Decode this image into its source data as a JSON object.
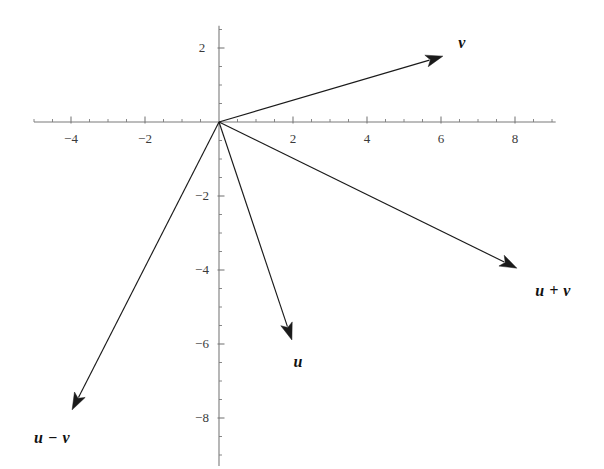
{
  "chart_data": {
    "type": "scatter",
    "title": "",
    "subtitle": "",
    "xlabel": "",
    "ylabel": "",
    "xlim": [
      -5.0,
      9.1
    ],
    "ylim": [
      -9.3,
      2.6
    ],
    "grid": false,
    "legend": "none",
    "origin_px": {
      "x": 219,
      "y": 122
    },
    "scale_px_per_unit": 37,
    "axis_color": "#7b7b7b",
    "vector_color": "#1a1a1a",
    "label_color": "#111111",
    "tick_label_color": "#3a3a3a",
    "x_axis": {
      "major_ticks": [
        -4,
        -2,
        2,
        4,
        6,
        8
      ],
      "major_tick_labels": [
        "-4",
        "-2",
        "2",
        "4",
        "6",
        "8"
      ],
      "minor_tick_step": 0.5,
      "range": [
        -5.0,
        9.1
      ]
    },
    "y_axis": {
      "major_ticks": [
        2,
        -2,
        -4,
        -6,
        -8
      ],
      "major_tick_labels": [
        "2",
        "-2",
        "-4",
        "-6",
        "-8"
      ],
      "minor_tick_step": 0.5,
      "range": [
        -9.3,
        2.6
      ]
    },
    "vectors": [
      {
        "name": "v",
        "label": "v",
        "start": [
          0,
          0
        ],
        "end": [
          6.05,
          1.78
        ],
        "label_pos": [
          6.57,
          2.14
        ]
      },
      {
        "name": "u",
        "label": "u",
        "start": [
          0,
          0
        ],
        "end": [
          1.97,
          -5.89
        ],
        "label_pos": [
          2.14,
          -6.49
        ]
      },
      {
        "name": "u+v",
        "label": "u + v",
        "start": [
          0,
          0
        ],
        "end": [
          8.05,
          -3.95
        ],
        "label_pos": [
          9.03,
          -4.57
        ]
      },
      {
        "name": "u-v",
        "label": "u − v",
        "start": [
          0,
          0
        ],
        "end": [
          -3.97,
          -7.78
        ],
        "label_pos": [
          -4.51,
          -8.54
        ]
      }
    ]
  }
}
